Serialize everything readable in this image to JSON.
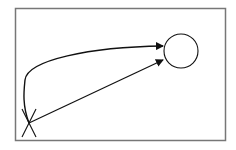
{
  "diagram": {
    "frame": {
      "x": 15.5,
      "y": 8.5,
      "width": 210,
      "height": 132,
      "stroke": "#777777"
    },
    "stroke_color": "#111111",
    "start_marker": {
      "type": "x-cross",
      "cx": 29,
      "cy": 123,
      "half_w": 7,
      "half_h": 14
    },
    "target_node": {
      "type": "circle",
      "cx": 181,
      "cy": 51,
      "r": 17
    },
    "edges": [
      {
        "id": "curved-arrow",
        "type": "curve",
        "path": "M 29 123 C 22 105, 24 90, 25 80 C 27 60, 90 47, 163 46",
        "arrow_tip": [
          163,
          46
        ]
      },
      {
        "id": "straight-arrow",
        "type": "line",
        "path": "M 29 123 L 163 60",
        "arrow_tip": [
          163,
          60
        ]
      }
    ]
  }
}
